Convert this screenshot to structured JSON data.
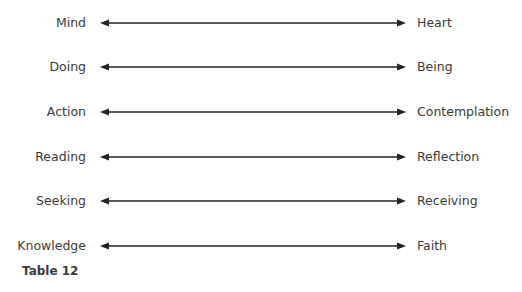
{
  "pairs": [
    {
      "left": "Mind",
      "right": "Heart"
    },
    {
      "left": "Doing",
      "right": "Being"
    },
    {
      "left": "Action",
      "right": "Contemplation"
    },
    {
      "left": "Reading",
      "right": "Reflection"
    },
    {
      "left": "Seeking",
      "right": "Receiving"
    },
    {
      "left": "Knowledge",
      "right": "Faith"
    }
  ],
  "caption": "Table 12",
  "colors": {
    "text": "#3a3a3a",
    "arrow": "#222222"
  }
}
